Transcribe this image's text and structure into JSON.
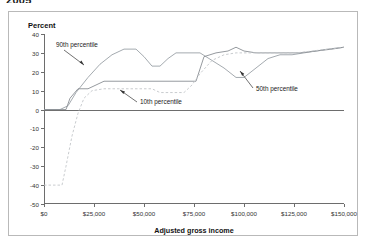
{
  "caption": {
    "year": "2005"
  },
  "chart_data": {
    "type": "line",
    "title": "",
    "xlabel": "Adjusted gross income",
    "ylabel": "Percent",
    "xlim": [
      0,
      150000
    ],
    "ylim": [
      -50,
      40
    ],
    "grid": false,
    "legend_position": "annotations-inline",
    "xticks": [
      0,
      25000,
      50000,
      75000,
      100000,
      125000,
      150000
    ],
    "xtick_labels": [
      "$0",
      "$25,000",
      "$50,000",
      "$75,000",
      "$100,000",
      "$125,000",
      "$150,000"
    ],
    "yticks": [
      40,
      30,
      20,
      10,
      0,
      -10,
      -20,
      -30,
      -40,
      -50
    ],
    "ytick_labels": [
      "40",
      "30",
      "20",
      "10",
      "0",
      "-10",
      "-20",
      "-30",
      "-40",
      "-50"
    ],
    "series": [
      {
        "name": "90th percentile",
        "style": "solid",
        "color": "#9aa0a6",
        "x": [
          0,
          8000,
          12000,
          16000,
          22000,
          28000,
          34000,
          40000,
          46000,
          50000,
          54000,
          58000,
          62000,
          66000,
          70000,
          74000,
          78000,
          84000,
          90000,
          96000,
          100000,
          106000,
          112000,
          118000,
          124000,
          130000,
          136000,
          142000,
          150000
        ],
        "y": [
          0,
          0,
          2,
          9,
          17,
          24,
          29,
          32,
          32,
          28,
          23,
          23,
          27,
          30,
          30,
          30,
          30,
          26,
          22,
          17,
          17,
          22,
          27,
          29,
          29,
          30,
          31,
          32,
          33
        ]
      },
      {
        "name": "50th percentile",
        "style": "solid",
        "color": "#8a8f94",
        "x": [
          0,
          11000,
          13000,
          17000,
          19000,
          22000,
          26000,
          30000,
          34000,
          40000,
          50000,
          60000,
          70000,
          76000,
          80000,
          86000,
          92000,
          96000,
          100000,
          106000,
          112000,
          120000,
          128000,
          136000,
          144000,
          150000
        ],
        "y": [
          0,
          0,
          6,
          11,
          11,
          11,
          13,
          15,
          15,
          15,
          15,
          15,
          15,
          15,
          28,
          30,
          31,
          33,
          31,
          30,
          30,
          30,
          30,
          31,
          32,
          33
        ]
      },
      {
        "name": "10th percentile",
        "style": "dashed",
        "color": "#c3c6c9",
        "x": [
          0,
          9000,
          11000,
          14000,
          17000,
          20000,
          24000,
          30000,
          38000,
          46000,
          54000,
          58000,
          62000,
          66000,
          70000,
          74000,
          78000,
          84000,
          90000,
          96000,
          102000,
          110000,
          118000,
          126000,
          134000,
          142000,
          150000
        ],
        "y": [
          -40,
          -40,
          -30,
          -14,
          -2,
          6,
          10,
          11,
          11,
          11,
          11,
          9,
          9,
          9,
          9,
          13,
          19,
          26,
          29,
          30,
          30,
          30,
          30,
          30,
          31,
          32,
          33
        ]
      }
    ],
    "annotations": [
      {
        "name": "90th percentile",
        "label": "90th percentile"
      },
      {
        "name": "50th percentile",
        "label": "50th percentile"
      },
      {
        "name": "10th percentile",
        "label": "10th percentile"
      }
    ]
  }
}
